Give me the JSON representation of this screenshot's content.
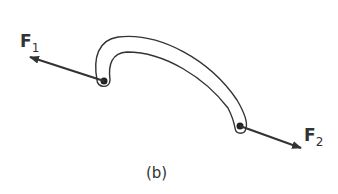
{
  "diagram": {
    "caption": "(b)",
    "forces": [
      {
        "id": "F1",
        "symbol": "F",
        "subscript": "1",
        "direction": "up-left"
      },
      {
        "id": "F2",
        "symbol": "F",
        "subscript": "2",
        "direction": "down-right"
      }
    ],
    "body": {
      "shape": "curved two-force member (hook/arc) with pins at both ends"
    },
    "colors": {
      "stroke": "#333333",
      "background": "#ffffff"
    }
  }
}
